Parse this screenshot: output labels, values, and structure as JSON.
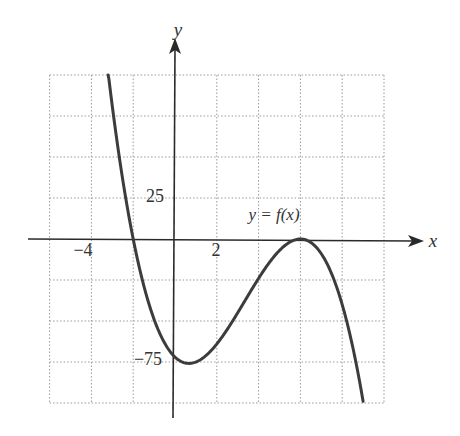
{
  "chart_data": {
    "type": "line",
    "title": "",
    "function_label": "y = f(x)",
    "formula_estimate": "f(x) = -(x + 2)(x - 6)^2",
    "xlabel": "x",
    "ylabel": "y",
    "xlim": [
      -6,
      10
    ],
    "ylim": [
      -100,
      100
    ],
    "x_grid_step": 2,
    "y_grid_step": 25,
    "grid": true,
    "grid_style": "dotted",
    "tick_labels": {
      "x": [
        {
          "value": -4,
          "label": "−4"
        },
        {
          "value": 2,
          "label": "2"
        }
      ],
      "y": [
        {
          "value": 25,
          "label": "25"
        },
        {
          "value": -75,
          "label": "−75"
        }
      ]
    },
    "key_points": {
      "roots": [
        -2,
        6
      ],
      "local_min": {
        "x": 0.67,
        "y": -75.9
      },
      "local_max": {
        "x": 6,
        "y": 0
      },
      "y_intercept": -72
    },
    "series": [
      {
        "name": "y = f(x)",
        "x": [
          -3.2,
          -3,
          -2.5,
          -2,
          -1.5,
          -1,
          -0.5,
          0,
          0.67,
          1,
          1.5,
          2,
          2.5,
          3,
          3.5,
          4,
          4.5,
          5,
          5.5,
          6,
          6.5,
          7,
          7.5,
          8,
          8.5,
          9
        ],
        "y": [
          101.6,
          81,
          54.6,
          0,
          -28.1,
          -49,
          -63.4,
          -72,
          -75.9,
          -75,
          -70.9,
          -64,
          -55.1,
          -45,
          -34.4,
          -24,
          -14.6,
          -7,
          -1.9,
          0,
          -2.1,
          -9,
          -21.4,
          -40,
          -65.6,
          -99
        ]
      }
    ]
  }
}
